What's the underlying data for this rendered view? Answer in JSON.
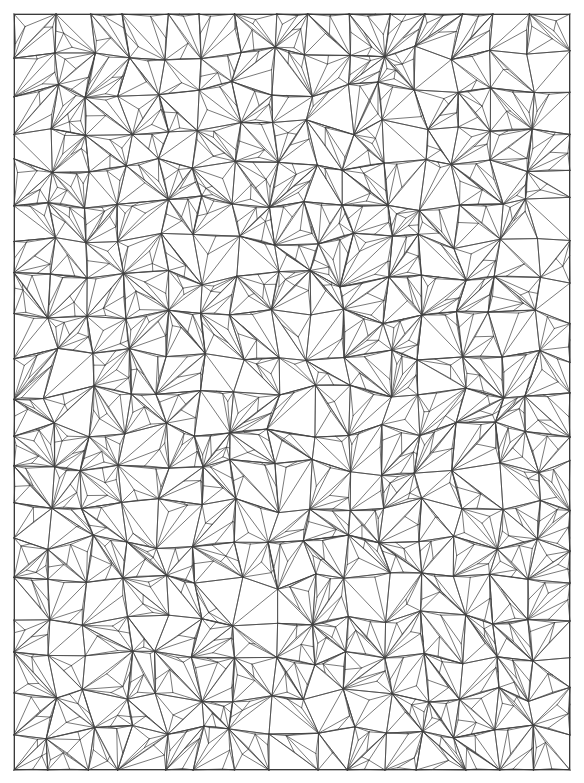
{
  "figure": {
    "kind": "triangular-mesh",
    "title": "",
    "width": 584,
    "height": 783,
    "background_color": "#ffffff"
  },
  "domain": {
    "name": "mesh-domain-rectangle",
    "x_min": 14,
    "y_min": 14,
    "x_max": 570,
    "y_max": 770,
    "border_visible": true,
    "border_color": "#3a3a3a",
    "border_width": 1
  },
  "mesh_style": {
    "edge_color": "#404040",
    "edge_width": 0.7,
    "vertex_color": "#000000",
    "vertex_radius": 0,
    "fill_color": "none",
    "antialias": true
  },
  "chart_data": {
    "type": "mesh",
    "title": "",
    "xlabel": "",
    "ylabel": "",
    "base_grid": {
      "cell_size_x": 37.07,
      "cell_size_y": 37.8,
      "columns": 15,
      "rows": 20
    },
    "refinement": {
      "scheme": "fan-subdivision",
      "levels": 2,
      "jitter_fraction": 0.22,
      "interior_point_probability": 0.82,
      "secondary_point_probability": 0.55
    },
    "counts": {
      "approx_vertices": 1450,
      "approx_triangles": 2800,
      "approx_edges": 4250
    },
    "random_seed": 20240517,
    "axis_ranges": {
      "x": [
        0,
        556
      ],
      "y": [
        0,
        756
      ]
    },
    "grid": false,
    "legend": "none"
  },
  "caption": {
    "text": ""
  }
}
